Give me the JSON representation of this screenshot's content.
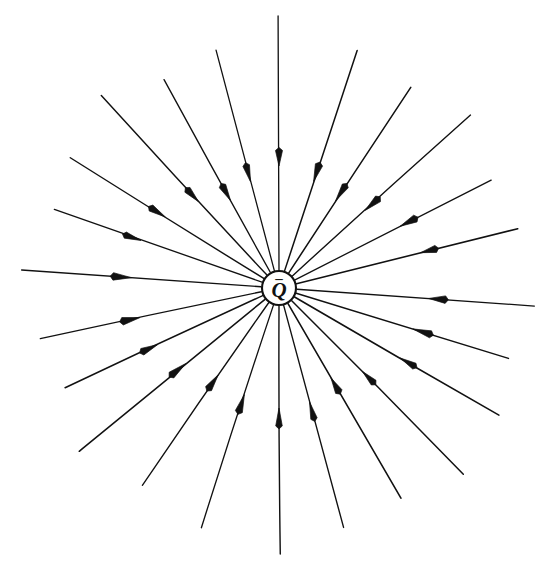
{
  "figure": {
    "kind": "electric-field-line-diagram",
    "background_color": "#ffffff",
    "line_color": "#111111"
  },
  "charge": {
    "label": "Q",
    "sign": "–",
    "sign_name": "minus-sign",
    "polarity": "negative",
    "center_x": 279,
    "center_y": 288,
    "radius": 17,
    "label_font_size": 21,
    "sign_font_size": 15,
    "label_offset_y": 9,
    "sign_offset_y": -5
  },
  "chart_data": {
    "type": "scatter",
    "xlabel": "",
    "ylabel": "",
    "center": [
      279,
      288
    ],
    "ray_count": 24,
    "arrow_direction": "inward",
    "rays": [
      {
        "angle": 270,
        "length": 266,
        "arrow_at": 120,
        "start": 18
      },
      {
        "angle": 285,
        "length": 248,
        "arrow_at": 118,
        "start": 18
      },
      {
        "angle": 300,
        "length": 243,
        "arrow_at": 104,
        "start": 18
      },
      {
        "angle": 315,
        "length": 262,
        "arrow_at": 118,
        "start": 18
      },
      {
        "angle": 330,
        "length": 254,
        "arrow_at": 140,
        "start": 18
      },
      {
        "angle": 343,
        "length": 240,
        "arrow_at": 140,
        "start": 18
      },
      {
        "angle": 356,
        "length": 256,
        "arrow_at": 150,
        "start": 18
      },
      {
        "angle": 14,
        "length": 246,
        "arrow_at": 146,
        "start": 18
      },
      {
        "angle": 27,
        "length": 238,
        "arrow_at": 136,
        "start": 18
      },
      {
        "angle": 42,
        "length": 258,
        "arrow_at": 116,
        "start": 18
      },
      {
        "angle": 57,
        "length": 240,
        "arrow_at": 104,
        "start": 18
      },
      {
        "angle": 72,
        "length": 250,
        "arrow_at": 112,
        "start": 18
      },
      {
        "angle": 90,
        "length": 272,
        "arrow_at": 122,
        "start": 18
      },
      {
        "angle": 105,
        "length": 246,
        "arrow_at": 110,
        "start": 18
      },
      {
        "angle": 119,
        "length": 238,
        "arrow_at": 100,
        "start": 18
      },
      {
        "angle": 133,
        "length": 262,
        "arrow_at": 118,
        "start": 18
      },
      {
        "angle": 148,
        "length": 246,
        "arrow_at": 134,
        "start": 18
      },
      {
        "angle": 161,
        "length": 238,
        "arrow_at": 146,
        "start": 18
      },
      {
        "angle": 176,
        "length": 258,
        "arrow_at": 148,
        "start": 18
      },
      {
        "angle": 192,
        "length": 244,
        "arrow_at": 142,
        "start": 18
      },
      {
        "angle": 205,
        "length": 236,
        "arrow_at": 134,
        "start": 18
      },
      {
        "angle": 219,
        "length": 258,
        "arrow_at": 120,
        "start": 18
      },
      {
        "angle": 235,
        "length": 240,
        "arrow_at": 106,
        "start": 18
      },
      {
        "angle": 252,
        "length": 252,
        "arrow_at": 112,
        "start": 18
      }
    ]
  }
}
